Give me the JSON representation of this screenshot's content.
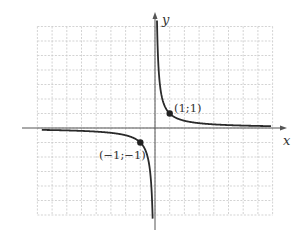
{
  "chart_data": {
    "type": "line",
    "title": "",
    "function": "y = 1/x",
    "xlabel": "x",
    "ylabel": "y",
    "xlim": [
      -8,
      8
    ],
    "ylim": [
      -6,
      7
    ],
    "grid": true,
    "grid_style": "dashed",
    "legend": "none",
    "series": [
      {
        "name": "branch-positive",
        "x": [
          0.125,
          0.25,
          0.5,
          1,
          2,
          4,
          8
        ],
        "y": [
          8,
          4,
          2,
          1,
          0.5,
          0.25,
          0.125
        ]
      },
      {
        "name": "branch-negative",
        "x": [
          -6,
          -4,
          -2,
          -1,
          -0.5,
          -0.25,
          -0.167
        ],
        "y": [
          -0.167,
          -0.25,
          -0.5,
          -1,
          -2,
          -4,
          -6
        ]
      }
    ],
    "annotations": [
      {
        "text": "(1;1)",
        "x": 1,
        "y": 1
      },
      {
        "text": "(−1;−1)",
        "x": -1,
        "y": -1
      }
    ]
  },
  "labels": {
    "x_axis": "x",
    "y_axis": "y",
    "point_a": "(1;1)",
    "point_b": "(−1;−1)"
  },
  "colors": {
    "curve": "#2a2a2a",
    "axis": "#555555",
    "grid": "#c8c8c8",
    "point": "#222222"
  }
}
